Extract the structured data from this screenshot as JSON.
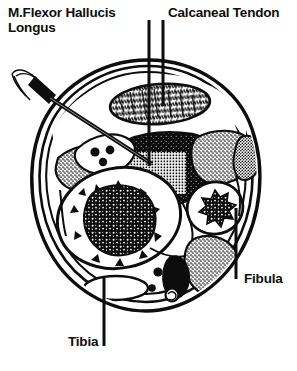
{
  "figure": {
    "view": "axial cross-section, right lower leg",
    "style": "black-and-white line drawing / halftone engraving",
    "background_color": "#ffffff",
    "ink_color": "#0d0d0d",
    "width": 297,
    "height": 371
  },
  "labels": {
    "flexor_hallucis_longus": {
      "line1": "M.Flexor Hallucis",
      "line2": "Longus",
      "full_text": "M.Flexor Hallucis Longus",
      "x": 8,
      "y": 6
    },
    "calcaneal_tendon": {
      "text": "Calcaneal Tendon",
      "x": 168,
      "y": 6
    },
    "fibula": {
      "text": "Fibula",
      "x": 244,
      "y": 272
    },
    "tibia": {
      "text": "Tibia",
      "x": 68,
      "y": 335
    }
  },
  "leader_lines": [
    {
      "name": "leader-flexor-hallucis-longus",
      "x1": 149,
      "y1": 20,
      "x2": 149,
      "y2": 166
    },
    {
      "name": "leader-calcaneal-tendon",
      "x1": 163,
      "y1": 20,
      "x2": 163,
      "y2": 106
    },
    {
      "name": "leader-fibula",
      "x1": 236,
      "y1": 208,
      "x2": 236,
      "y2": 279
    },
    {
      "name": "leader-tibia",
      "x1": 104,
      "y1": 278,
      "x2": 104,
      "y2": 346
    }
  ],
  "structures": [
    {
      "name": "skin-and-fascia-layers",
      "description": "concentric outer contour lines forming the limb outline",
      "fill": "white",
      "stroke": "#0d0d0d"
    },
    {
      "name": "calcaneal-tendon",
      "description": "stippled oval tendon at posterior (top)",
      "fill": "stipple"
    },
    {
      "name": "flexor-hallucis-longus-muscle",
      "description": "dark muscle belly, deep posterior compartment, with crosshatched injection target",
      "fill": "black"
    },
    {
      "name": "injection-target-crosshatch",
      "description": "white grid / crosshatch region marking the needle target inside the muscle",
      "fill": "crosshatch"
    },
    {
      "name": "tibia",
      "description": "large anterior-medial bone, white cortex with dark trabecular marrow core",
      "fill": "white"
    },
    {
      "name": "tibia-marrow",
      "description": "irregular dark trabecular bone marrow",
      "fill": "black"
    },
    {
      "name": "fibula",
      "description": "small lateral bone, white cortex with dark star-shaped marrow core",
      "fill": "white"
    },
    {
      "name": "fibula-marrow",
      "description": "star-shaped dark trabecular core",
      "fill": "black"
    },
    {
      "name": "tibial-nerve-wedge",
      "description": "white wedge containing three dark nerve fascicle circles",
      "fill": "white"
    },
    {
      "name": "posterior-tibial-vessels",
      "description": "small vessel profiles in the lower posterior compartment",
      "fill": "black"
    },
    {
      "name": "stippled-muscle-anterior-left",
      "description": "stippled muscle belly, left side",
      "fill": "stipple"
    },
    {
      "name": "stippled-muscle-lateral-right",
      "description": "stippled muscle belly, right/lateral side",
      "fill": "stipple"
    },
    {
      "name": "stippled-muscle-posterolateral",
      "description": "elongated stippled muscle, lower right",
      "fill": "stipple"
    }
  ],
  "needle": {
    "name": "injection-needle",
    "description": "needle with dark hub and thin wire leads entering from the upper left, angled toward the flexor hallucis longus target",
    "entry_point": {
      "x": 40,
      "y": 78
    },
    "tip_point": {
      "x": 150,
      "y": 162
    },
    "hub_color": "#0d0d0d"
  }
}
